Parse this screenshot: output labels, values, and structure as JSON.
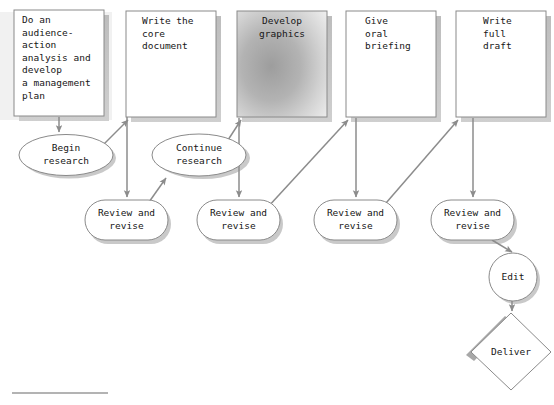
{
  "diagram": {
    "colors": {
      "stroke": "#8a8a8a",
      "shadow": "#b8b8b8",
      "arrow": "#8c8c8c",
      "text": "#161616",
      "fill": "#ffffff",
      "gradient_dark": "#9d9d9d",
      "gradient_light": "#e9e9e9",
      "rule": "#9a9a9a",
      "band": "#e2e2e2"
    },
    "process_boxes": [
      {
        "id": "audience-action-analysis",
        "text": "Do an\naudience-\naction\nanalysis and\ndevelop\na management\nplan",
        "align": "left",
        "shaded": false
      },
      {
        "id": "write-core-document",
        "text": "Write the\ncore\ndocument",
        "align": "left",
        "shaded": false
      },
      {
        "id": "develop-graphics",
        "text": "Develop\ngraphics",
        "align": "center",
        "shaded": true
      },
      {
        "id": "give-oral-briefing",
        "text": "Give\noral\nbriefing",
        "align": "left",
        "shaded": false
      },
      {
        "id": "write-full-draft",
        "text": "Write\nfull\ndraft",
        "align": "left",
        "shaded": false
      }
    ],
    "ellipses": [
      {
        "id": "begin-research",
        "text": "Begin\nresearch"
      },
      {
        "id": "continue-research",
        "text": "Continue\nresearch"
      }
    ],
    "review_nodes": [
      {
        "id": "review-revise-1",
        "text": "Review and\nrevise"
      },
      {
        "id": "review-revise-2",
        "text": "Review and\nrevise"
      },
      {
        "id": "review-revise-3",
        "text": "Review and\nrevise"
      },
      {
        "id": "review-revise-4",
        "text": "Review and\nrevise"
      }
    ],
    "circle": {
      "id": "edit",
      "text": "Edit"
    },
    "diamond": {
      "id": "deliver",
      "text": "Deliver"
    }
  }
}
